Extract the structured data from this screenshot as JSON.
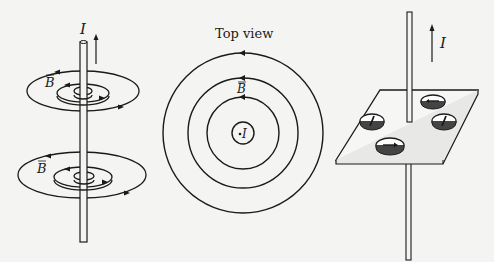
{
  "figure": {
    "panels": [
      {
        "id": "side-view",
        "current_label": "I",
        "field_label_top": "B",
        "field_label_bottom": "B"
      },
      {
        "id": "top-view",
        "title": "Top view",
        "field_label": "B",
        "current_dot": "·",
        "current_label": "I"
      },
      {
        "id": "compass-board",
        "current_label": "I"
      }
    ],
    "colors": {
      "ink": "#1a1a1a",
      "background": "#f4f4f2",
      "board": "#f6f6f4"
    }
  }
}
